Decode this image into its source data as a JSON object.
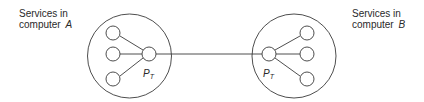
{
  "diagram": {
    "computer_a": {
      "label_line1": "Services in",
      "label_line2_prefix": "computer ",
      "label_line2_letter": "A",
      "port_label": "P",
      "port_subscript": "T",
      "service_count": 3
    },
    "computer_b": {
      "label_line1": "Services in",
      "label_line2_prefix": "computer ",
      "label_line2_letter": "B",
      "port_label": "P",
      "port_subscript": "T",
      "service_count": 3
    },
    "link": "connection between P_T ports"
  },
  "colors": {
    "stroke": "#3a3a3a",
    "text": "#2a2a2a",
    "background": "#ffffff"
  }
}
